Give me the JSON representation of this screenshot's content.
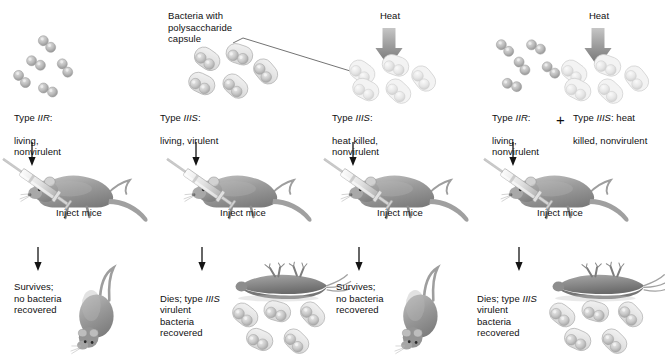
{
  "figure": {
    "palette": {
      "rough_bacteria": "#b9b9b9",
      "smooth_bacteria": "#c9c9c9",
      "killed_bacteria": "#dcdcdc",
      "mouse_body": "#9a9a9a",
      "heat_arrow": "#8e8e8e",
      "thin_arrow": "#1a1a1a",
      "leader_line": "#5a5a5a",
      "text": "#101010",
      "background": "#ffffff"
    },
    "callout": {
      "label": "Bacteria with\npolysaccharide\ncapsule"
    },
    "columns": [
      {
        "id": "column-1",
        "heat": null,
        "culture_type": "rough",
        "culture_label_prefix": "Type ",
        "culture_label_italic": "IIR",
        "culture_label_suffix": ":",
        "culture_label_rest": "living,\nnonvirulent",
        "inject_label": "Inject mice",
        "result_prefix": "Survives;\nno bacteria\nrecovered",
        "result_italic": "",
        "result_suffix": "",
        "outcome": "alive",
        "recovered_bacteria": false
      },
      {
        "id": "column-2",
        "heat": null,
        "culture_type": "smooth",
        "culture_label_prefix": "Type ",
        "culture_label_italic": "IIIS",
        "culture_label_suffix": ":",
        "culture_label_rest": "living, virulent",
        "inject_label": "Inject mice",
        "result_prefix": "Dies; type ",
        "result_italic": "IIIS",
        "result_suffix": "\nvirulent\nbacteria\nrecovered",
        "outcome": "dead",
        "recovered_bacteria": true
      },
      {
        "id": "column-3",
        "heat": "Heat",
        "culture_type": "killed",
        "culture_label_prefix": "Type ",
        "culture_label_italic": "IIIS",
        "culture_label_suffix": ":",
        "culture_label_rest": "heat killed,\nnonvirulent",
        "inject_label": "Inject mice",
        "result_prefix": "Survives;\nno bacteria\nrecovered",
        "result_italic": "",
        "result_suffix": "",
        "outcome": "alive",
        "recovered_bacteria": false
      },
      {
        "id": "column-4",
        "heat": "Heat",
        "culture_type": "mixed",
        "culture_label_prefix": "Type ",
        "culture_label_italic": "IIR",
        "culture_label_suffix": ":",
        "culture_label_rest": "living,\nnonvirulent",
        "plus_sign": "+",
        "culture_label_b_prefix": "Type ",
        "culture_label_b_italic": "IIIS",
        "culture_label_b_suffix": ": heat",
        "culture_label_b_rest": "killed, nonvirulent",
        "inject_label": "Inject mice",
        "result_prefix": "Dies; type ",
        "result_italic": "IIIS",
        "result_suffix": "\nvirulent\nbacteria\nrecovered",
        "outcome": "dead",
        "recovered_bacteria": true
      }
    ]
  }
}
